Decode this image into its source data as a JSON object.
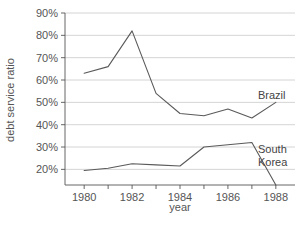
{
  "chart_data": {
    "type": "line",
    "title": "",
    "xlabel": "year",
    "ylabel": "debt service ratio",
    "xlim": [
      1979.2,
      1988.8
    ],
    "ylim": [
      13,
      90
    ],
    "grid": true,
    "legend_position": "inline-right",
    "x": [
      1980,
      1981,
      1982,
      1983,
      1984,
      1985,
      1986,
      1987,
      1988
    ],
    "xtick_labels": [
      "1980",
      "1982",
      "1984",
      "1986",
      "1988"
    ],
    "xtick_values": [
      1980,
      1982,
      1984,
      1986,
      1988
    ],
    "xminor_tick_values": [
      1981,
      1983,
      1985,
      1987
    ],
    "ytick_labels": [
      "90%",
      "80%",
      "70%",
      "60%",
      "50%",
      "40%",
      "30%",
      "20%"
    ],
    "ytick_values": [
      90,
      80,
      70,
      60,
      50,
      40,
      30,
      20
    ],
    "series": [
      {
        "name": "Brazil",
        "label": "Brazil",
        "label_lines": [
          "Brazil"
        ],
        "values": [
          63,
          66,
          82,
          54,
          45,
          44,
          47,
          43,
          50
        ]
      },
      {
        "name": "South Korea",
        "label": "South Korea",
        "label_lines": [
          "South",
          "Korea"
        ],
        "values": [
          19.5,
          20.5,
          22.5,
          22,
          21.5,
          30,
          31,
          32,
          13
        ]
      }
    ]
  },
  "axes": {
    "y_title": "debt service ratio",
    "x_title": "year"
  },
  "colors": {
    "line": "#5a5a5a",
    "grid": "#c9c9c9",
    "axis": "#555555",
    "text": "#555555",
    "background": "#ffffff"
  }
}
